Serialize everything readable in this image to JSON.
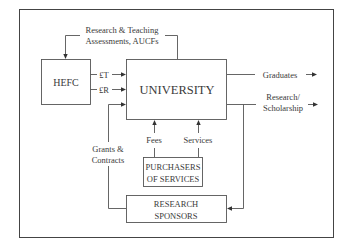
{
  "diagram": {
    "nodes": {
      "hefc": {
        "label": "HEFC"
      },
      "university": {
        "label": "UNIVERSITY"
      },
      "purchasers": {
        "label_line1": "PURCHASERS",
        "label_line2": "OF SERVICES"
      },
      "sponsors": {
        "label_line1": "RESEARCH",
        "label_line2": "SPONSORS"
      }
    },
    "edges": {
      "assessments": {
        "line1": "Research & Teaching",
        "line2": "Assessments, AUCFs"
      },
      "teaching_funds": {
        "label": "£T"
      },
      "research_funds": {
        "label": "£R"
      },
      "graduates": {
        "label": "Graduates"
      },
      "research_output": {
        "line1": "Research/",
        "line2": "Scholarship"
      },
      "grants": {
        "line1": "Grants &",
        "line2": "Contracts"
      },
      "fees": {
        "label": "Fees"
      },
      "services": {
        "label": "Services"
      }
    },
    "colors": {
      "line": "#555555",
      "text": "#3a3a3a",
      "background": "#ffffff"
    }
  }
}
